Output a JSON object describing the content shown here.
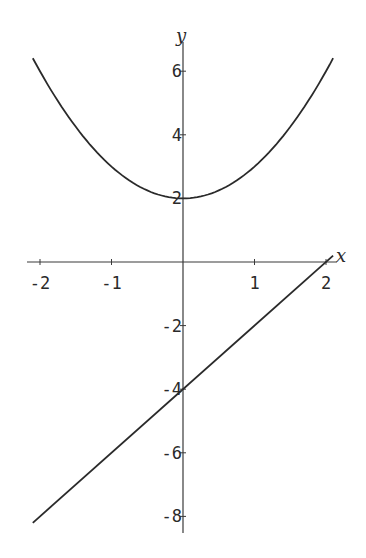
{
  "chart_data": {
    "type": "line",
    "title": "",
    "xlabel": "x",
    "ylabel": "y",
    "xlim": [
      -2.1,
      2.1
    ],
    "ylim": [
      -8.3,
      6.6
    ],
    "x_ticks": [
      {
        "value": -2,
        "label": "-2"
      },
      {
        "value": -1,
        "label": "-1"
      },
      {
        "value": 1,
        "label": "1"
      },
      {
        "value": 2,
        "label": "2"
      }
    ],
    "y_ticks": [
      {
        "value": 6,
        "label": "6"
      },
      {
        "value": 4,
        "label": "4"
      },
      {
        "value": 2,
        "label": "2"
      },
      {
        "value": -2,
        "label": "-2"
      },
      {
        "value": -4,
        "label": "-4"
      },
      {
        "value": -6,
        "label": "-6"
      },
      {
        "value": -8,
        "label": "-8"
      }
    ],
    "grid": false,
    "legend": null,
    "series": [
      {
        "name": "parabola",
        "formula": "y = x^2 + 2",
        "x": [
          -2.1,
          -1.5,
          -1.0,
          -0.5,
          0.0,
          0.5,
          1.0,
          1.5,
          2.1
        ],
        "values": [
          6.41,
          4.25,
          3.0,
          2.25,
          2.0,
          2.25,
          3.0,
          4.25,
          6.41
        ],
        "color": "#2a2a2a"
      },
      {
        "name": "line",
        "formula": "y = 2x - 4",
        "x": [
          -2.1,
          2.1
        ],
        "values": [
          -8.2,
          0.2
        ],
        "color": "#2a2a2a"
      }
    ]
  },
  "axes": {
    "x_name": "x",
    "y_name": "y"
  },
  "colors": {
    "background": "#ffffff",
    "ink": "#2a2a2a"
  }
}
